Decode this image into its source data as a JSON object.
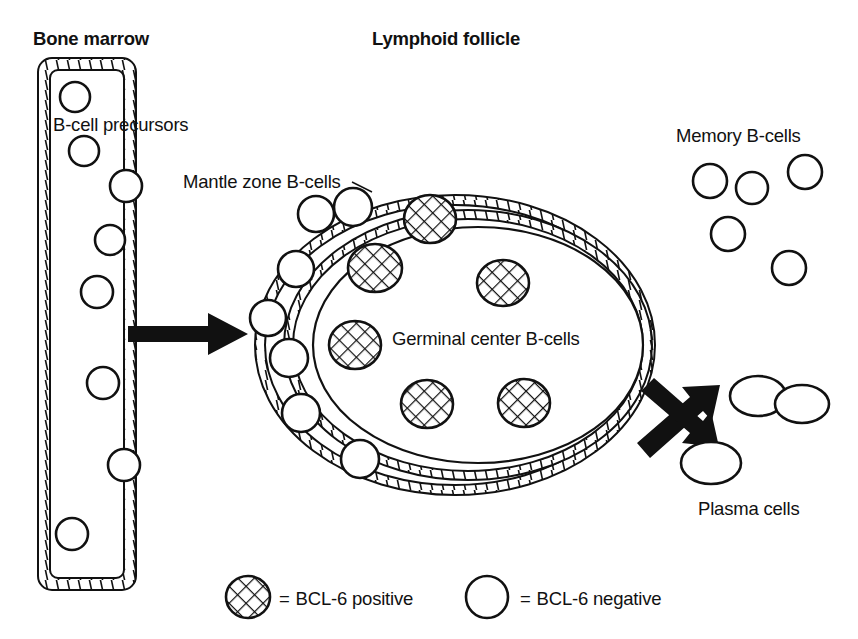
{
  "figure": {
    "title_bone_marrow": "Bone marrow",
    "title_lymphoid_follicle": "Lymphoid follicle",
    "labels": {
      "b_cell_precursors": "B-cell precursors",
      "mantle_zone": "Mantle zone B-cells",
      "germinal_center": "Germinal center B-cells",
      "memory_b_cells": "Memory B-cells",
      "plasma_cells": "Plasma cells"
    },
    "legend": [
      {
        "symbol": "hatched-circle",
        "equals": "=",
        "text": "BCL-6 positive"
      },
      {
        "symbol": "open-circle",
        "equals": "=",
        "text": "BCL-6 negative"
      }
    ],
    "colors": {
      "ink": "#111111",
      "background": "#ffffff"
    },
    "counts": {
      "b_cell_precursors": 7,
      "mantle_zone_b_cells": 7,
      "germinal_center_b_cells": 6,
      "memory_b_cells": 5,
      "plasma_cells": 3
    },
    "arrows": [
      {
        "name": "marrow-to-follicle",
        "direction": "right"
      },
      {
        "name": "follicle-to-memory",
        "direction": "up-right"
      },
      {
        "name": "follicle-to-plasma",
        "direction": "down-right"
      }
    ]
  },
  "geometry": {
    "bone_marrow_box": {
      "x": 38,
      "y": 58,
      "w": 98,
      "h": 532,
      "r": 14
    },
    "follicle_outer": {
      "cx": 455,
      "cy": 345,
      "rx": 200,
      "ry": 150
    },
    "follicle_inner": {
      "cx": 468,
      "cy": 345,
      "rx": 184,
      "ry": 135
    },
    "germinal_ellipse": {
      "cx": 478,
      "cy": 345,
      "rx": 165,
      "ry": 118
    },
    "precursor_cells": [
      {
        "cx": 75,
        "cy": 97,
        "r": 15
      },
      {
        "cx": 84,
        "cy": 151,
        "r": 15
      },
      {
        "cx": 126,
        "cy": 186,
        "r": 16
      },
      {
        "cx": 110,
        "cy": 240,
        "r": 15
      },
      {
        "cx": 97,
        "cy": 292,
        "r": 16
      },
      {
        "cx": 103,
        "cy": 383,
        "r": 16
      },
      {
        "cx": 124,
        "cy": 465,
        "r": 16
      },
      {
        "cx": 72,
        "cy": 534,
        "r": 16
      }
    ],
    "mantle_cells": [
      {
        "cx": 316,
        "cy": 214,
        "r": 18
      },
      {
        "cx": 353,
        "cy": 207,
        "r": 19
      },
      {
        "cx": 296,
        "cy": 269,
        "r": 18
      },
      {
        "cx": 268,
        "cy": 318,
        "r": 18
      },
      {
        "cx": 289,
        "cy": 358,
        "r": 19
      },
      {
        "cx": 301,
        "cy": 413,
        "r": 19
      },
      {
        "cx": 360,
        "cy": 459,
        "r": 19
      }
    ],
    "germinal_cells": [
      {
        "cx": 430,
        "cy": 219,
        "rx": 26,
        "ry": 24
      },
      {
        "cx": 375,
        "cy": 268,
        "rx": 27,
        "ry": 24
      },
      {
        "cx": 503,
        "cy": 283,
        "rx": 26,
        "ry": 23
      },
      {
        "cx": 355,
        "cy": 345,
        "rx": 26,
        "ry": 24
      },
      {
        "cx": 427,
        "cy": 404,
        "rx": 26,
        "ry": 24
      },
      {
        "cx": 524,
        "cy": 403,
        "rx": 26,
        "ry": 24
      }
    ],
    "memory_cells": [
      {
        "cx": 710,
        "cy": 181,
        "r": 17
      },
      {
        "cx": 752,
        "cy": 188,
        "r": 16
      },
      {
        "cx": 805,
        "cy": 172,
        "r": 17
      },
      {
        "cx": 728,
        "cy": 234,
        "r": 17
      },
      {
        "cx": 789,
        "cy": 268,
        "r": 17
      }
    ],
    "plasma_cells": [
      {
        "cx": 758,
        "cy": 396,
        "rx": 28,
        "ry": 20
      },
      {
        "cx": 802,
        "cy": 404,
        "rx": 27,
        "ry": 19
      },
      {
        "cx": 711,
        "cy": 463,
        "rx": 30,
        "ry": 21
      }
    ]
  }
}
